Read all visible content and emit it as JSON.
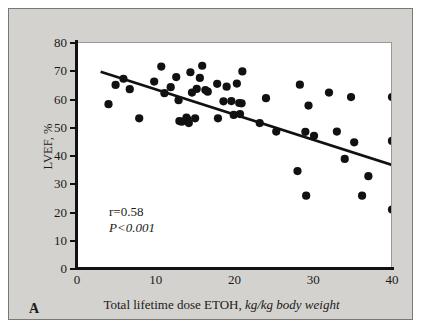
{
  "figure": {
    "panel_letter": "A",
    "background_color": "#d4d2ce",
    "plot_background_color": "#ffffff",
    "marker_color": "#111111",
    "line_color": "#111111"
  },
  "annotations": {
    "correlation": "r=0.58",
    "pvalue": "P<0.001"
  },
  "axis_labels": {
    "x_main": "Total lifetime dose ETOH,",
    "x_italic": "kg/kg body weight",
    "y": "LVEF, %"
  },
  "chart_data": {
    "type": "scatter",
    "title": "",
    "xlabel": "Total lifetime dose ETOH, kg/kg body weight",
    "ylabel": "LVEF, %",
    "xlim": [
      0,
      40
    ],
    "ylim": [
      0,
      80
    ],
    "xticks": [
      0,
      10,
      20,
      30,
      40
    ],
    "yticks": [
      0,
      10,
      20,
      30,
      40,
      50,
      60,
      70,
      80
    ],
    "grid": false,
    "legend": null,
    "correlation_r": 0.58,
    "p_value": "<0.001",
    "points": [
      [
        4.0,
        58.0
      ],
      [
        4.9,
        64.8
      ],
      [
        5.9,
        67.0
      ],
      [
        6.7,
        63.3
      ],
      [
        7.9,
        53.0
      ],
      [
        9.8,
        66.0
      ],
      [
        10.7,
        71.3
      ],
      [
        11.1,
        61.9
      ],
      [
        11.9,
        64.0
      ],
      [
        12.6,
        67.6
      ],
      [
        12.9,
        59.4
      ],
      [
        13.0,
        52.0
      ],
      [
        13.3,
        51.8
      ],
      [
        13.9,
        53.2
      ],
      [
        14.0,
        52.6
      ],
      [
        14.2,
        51.3
      ],
      [
        14.4,
        69.3
      ],
      [
        14.6,
        62.1
      ],
      [
        15.0,
        53.0
      ],
      [
        15.2,
        63.4
      ],
      [
        15.6,
        67.3
      ],
      [
        15.9,
        71.6
      ],
      [
        16.3,
        63.0
      ],
      [
        16.6,
        62.4
      ],
      [
        17.8,
        65.2
      ],
      [
        17.9,
        53.0
      ],
      [
        18.6,
        59.0
      ],
      [
        19.0,
        64.2
      ],
      [
        19.6,
        59.1
      ],
      [
        19.9,
        54.2
      ],
      [
        20.3,
        65.3
      ],
      [
        20.6,
        58.4
      ],
      [
        20.7,
        54.5
      ],
      [
        20.9,
        58.3
      ],
      [
        21.0,
        69.6
      ],
      [
        23.2,
        51.3
      ],
      [
        24.0,
        60.1
      ],
      [
        25.3,
        48.3
      ],
      [
        28.0,
        34.3
      ],
      [
        28.3,
        64.9
      ],
      [
        29.0,
        48.2
      ],
      [
        29.1,
        25.6
      ],
      [
        29.4,
        57.5
      ],
      [
        30.1,
        46.8
      ],
      [
        32.0,
        62.1
      ],
      [
        33.0,
        48.3
      ],
      [
        34.0,
        38.6
      ],
      [
        34.8,
        60.5
      ],
      [
        35.2,
        44.5
      ],
      [
        36.2,
        25.6
      ],
      [
        37.0,
        32.5
      ],
      [
        40.0,
        60.5
      ],
      [
        40.0,
        45.0
      ],
      [
        40.0,
        20.7
      ]
    ],
    "regression_line": {
      "x_start": 3.0,
      "y_start": 69.5,
      "x_end": 40.0,
      "y_end": 36.5
    }
  }
}
